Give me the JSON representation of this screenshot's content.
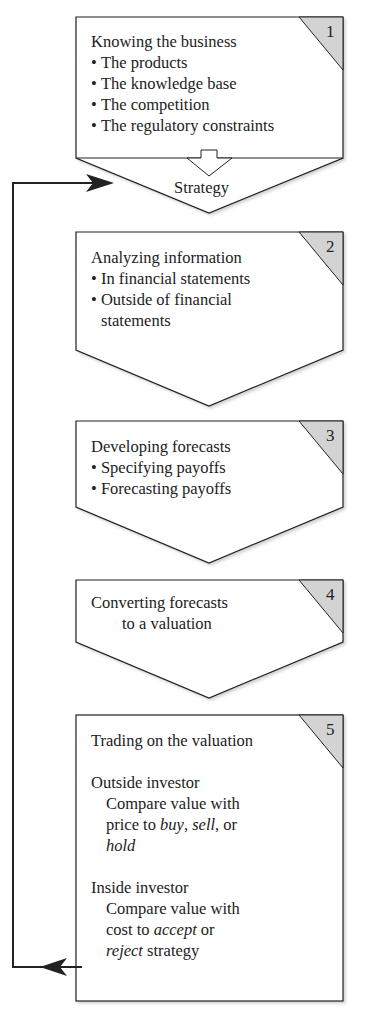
{
  "diagram": {
    "steps": [
      {
        "number": "1",
        "title": "Knowing the business",
        "bullets": [
          "The products",
          "The knowledge base",
          "The competition",
          "The regulatory constraints"
        ],
        "output_label": "Strategy"
      },
      {
        "number": "2",
        "title": "Analyzing information",
        "bullets": [
          "In financial statements",
          "Outside of financial"
        ],
        "bullet_continuation": "statements"
      },
      {
        "number": "3",
        "title": "Developing forecasts",
        "bullets": [
          "Specifying payoffs",
          "Forecasting payoffs"
        ]
      },
      {
        "number": "4",
        "title": "Converting forecasts",
        "title_line2": "to a valuation"
      },
      {
        "number": "5",
        "title": "Trading on the valuation",
        "outside": {
          "heading": "Outside investor",
          "line1": "Compare value with",
          "line2_pre": "price to ",
          "buy": "buy",
          "comma1": ", ",
          "sell": "sell",
          "line2_post": ", or",
          "hold": "hold"
        },
        "inside": {
          "heading": "Inside investor",
          "line1": "Compare value with",
          "line2_pre": "cost to ",
          "accept": "accept",
          "line2_post": " or",
          "reject": "reject",
          "line3_post": " strategy"
        }
      }
    ],
    "colors": {
      "stroke": "#222222",
      "corner_fill": "#d3d3d3",
      "box_fill": "#ffffff"
    }
  }
}
